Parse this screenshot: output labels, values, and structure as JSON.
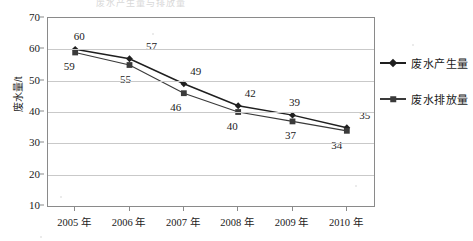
{
  "title_ghost": "废水产生量与排放量",
  "axis": {
    "y_title": "废水量/t",
    "y_ticks": [
      "70",
      "60",
      "50",
      "40",
      "30",
      "20",
      "10"
    ],
    "x_ticks": [
      "2005 年",
      "2006 年",
      "2007 年",
      "2008 年",
      "2009 年",
      "2010 年"
    ]
  },
  "legend": {
    "items": [
      {
        "label": "废水产生量",
        "marker": "diamond-marker",
        "color": "#1f1f1f"
      },
      {
        "label": "废水排放量",
        "marker": "square-marker",
        "color": "#3a3a3a"
      }
    ]
  },
  "chart_data": {
    "type": "line",
    "title": "废水产生量与排放量",
    "xlabel": "",
    "ylabel": "废水量/t",
    "categories": [
      "2005 年",
      "2006 年",
      "2007 年",
      "2008 年",
      "2009 年",
      "2010 年"
    ],
    "series": [
      {
        "name": "废水产生量",
        "marker": "diamond",
        "color": "#1f1f1f",
        "label_position": "above",
        "values": [
          60,
          57,
          49,
          42,
          39,
          35
        ]
      },
      {
        "name": "废水排放量",
        "marker": "square",
        "color": "#3a3a3a",
        "label_position": "below",
        "values": [
          59,
          55,
          46,
          40,
          37,
          34
        ]
      }
    ],
    "ylim": [
      10,
      70
    ],
    "ytick_step": 10,
    "grid": "horizontal",
    "legend_position": "right"
  }
}
